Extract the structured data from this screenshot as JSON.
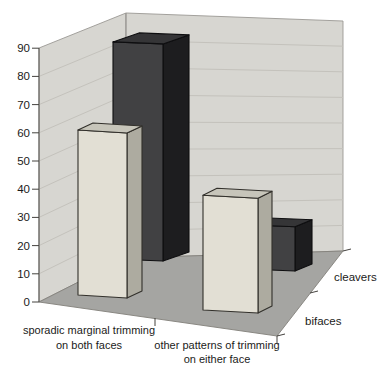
{
  "chart_data": {
    "type": "bar",
    "subtype": "3d-column",
    "title": "",
    "xlabel": "",
    "ylabel": "",
    "categories": [
      "sporadic marginal trimming on both faces",
      "other patterns of trimming on either face"
    ],
    "category_label_lines": [
      [
        "sporadic marginal trimming",
        "on both faces"
      ],
      [
        "other patterns of trimming",
        "on either face"
      ]
    ],
    "series": [
      {
        "name": "bifaces",
        "values": [
          60,
          43
        ]
      },
      {
        "name": "cleavers",
        "values": [
          81,
          17
        ]
      }
    ],
    "depth_axis_labels": [
      "bifaces",
      "cleavers"
    ],
    "yticks": [
      0,
      10,
      20,
      30,
      40,
      50,
      60,
      70,
      80,
      90
    ],
    "ylim": [
      0,
      90
    ],
    "grid": true,
    "legend_position": "depth-axis-right",
    "style": {
      "wall": "#d7d6d1",
      "wall_grid": "#c4c2bc",
      "wall_edge": "#9b9994",
      "floor": "#a5a5a2",
      "floor_edge": "#82807b",
      "axis": "#54524e",
      "tick": "#45433f",
      "text": "#1b1b19",
      "bifaces_fill": {
        "front": "#e2dfd4",
        "side": "#adaba0",
        "top": "#c7c5ba",
        "edge": "#32302b"
      },
      "cleavers_fill": {
        "front": "#414143",
        "side": "#1d1d1f",
        "top": "#353537",
        "edge": "#0e0e10"
      }
    }
  }
}
